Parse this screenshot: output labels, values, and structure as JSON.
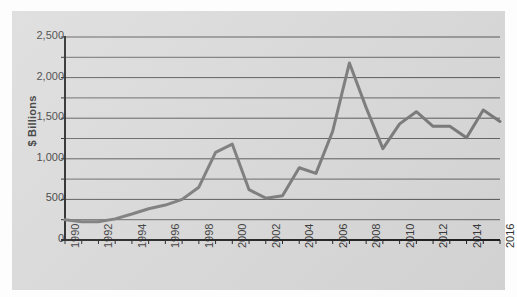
{
  "chart_data": {
    "type": "line",
    "title": "",
    "subtitle": "",
    "xlabel": "",
    "ylabel": "$ Billions",
    "xlim": [
      1990,
      2016
    ],
    "ylim": [
      0,
      2500
    ],
    "grid": true,
    "legend_position": "none",
    "line_color": "#767676",
    "panel_color": "#d9d9d9",
    "gridline_color": "#4a4a4a",
    "axis_color": "#1c1c1c",
    "y_ticks_major": [
      0,
      500,
      1000,
      1500,
      2000,
      2500
    ],
    "y_tick_labels": [
      "0",
      "500",
      "1,000",
      "1,500",
      "2,000",
      "2,500"
    ],
    "y_ticks_minor": [
      250,
      750,
      1250,
      1750,
      2250
    ],
    "x_ticks_all": [
      1990,
      1991,
      1992,
      1993,
      1994,
      1995,
      1996,
      1997,
      1998,
      1999,
      2000,
      2001,
      2002,
      2003,
      2004,
      2005,
      2006,
      2007,
      2008,
      2009,
      2010,
      2011,
      2012,
      2013,
      2014,
      2015,
      2016
    ],
    "x_tick_labels": [
      "1990",
      "1992",
      "1994",
      "1996",
      "1998",
      "2000",
      "2002",
      "2004",
      "2006",
      "2008",
      "2010",
      "2012",
      "2014",
      "2016"
    ],
    "x": [
      1990,
      1991,
      1992,
      1993,
      1994,
      1995,
      1996,
      1997,
      1998,
      1999,
      2000,
      2001,
      2002,
      2003,
      2004,
      2005,
      2006,
      2007,
      2008,
      2009,
      2010,
      2011,
      2012,
      2013,
      2014,
      2015,
      2016
    ],
    "values": [
      250,
      225,
      225,
      260,
      320,
      385,
      430,
      500,
      650,
      1080,
      1180,
      620,
      515,
      545,
      890,
      820,
      1340,
      2180,
      1630,
      1125,
      1430,
      1580,
      1400,
      1400,
      1260,
      1600,
      1460
    ],
    "series": [
      {
        "name": "$ Billions",
        "values": [
          250,
          225,
          225,
          260,
          320,
          385,
          430,
          500,
          650,
          1080,
          1180,
          620,
          515,
          545,
          890,
          820,
          1340,
          2180,
          1630,
          1125,
          1430,
          1580,
          1400,
          1400,
          1260,
          1600,
          1460
        ]
      }
    ]
  }
}
